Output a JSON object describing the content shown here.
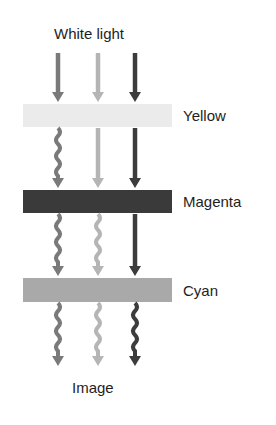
{
  "title": "White light",
  "footer": "Image",
  "filters": [
    {
      "label": "Yellow",
      "color": "#ebebeb",
      "y": 104,
      "h": 23
    },
    {
      "label": "Magenta",
      "color": "#3a3a3a",
      "y": 190,
      "h": 23
    },
    {
      "label": "Cyan",
      "color": "#a9a9a9",
      "y": 278,
      "h": 24
    }
  ],
  "rays": [
    {
      "name": "red",
      "color": "#7a7a7a",
      "x": 58
    },
    {
      "name": "green",
      "color": "#b5b5b5",
      "x": 98
    },
    {
      "name": "blue",
      "color": "#3c3c3c",
      "x": 135
    }
  ]
}
